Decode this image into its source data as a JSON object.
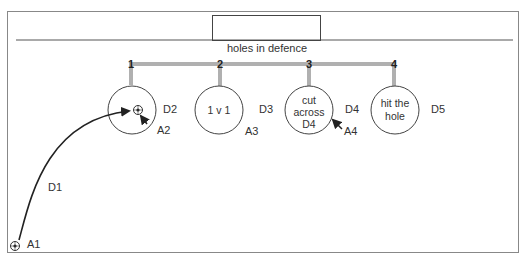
{
  "title": "holes in defence",
  "holes": [
    {
      "number": "1",
      "circle_text": [],
      "defender": "D2",
      "attacker": "A2"
    },
    {
      "number": "2",
      "circle_text": [
        "1 v 1"
      ],
      "defender": "D3",
      "attacker": "A3"
    },
    {
      "number": "3",
      "circle_text": [
        "cut",
        "across",
        "D4"
      ],
      "defender": "D4",
      "attacker": "A4"
    },
    {
      "number": "4",
      "circle_text": [
        "hit the",
        "hole"
      ],
      "defender": "D5",
      "attacker": ""
    }
  ],
  "players": {
    "start_attacker": "A1",
    "run_defender": "D1"
  },
  "colors": {
    "line": "#444444",
    "bar": "#b0b0b0",
    "arrow": "#222222"
  }
}
